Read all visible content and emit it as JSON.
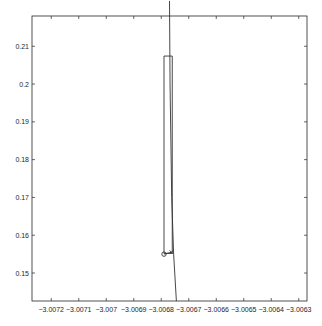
{
  "chart_data": {
    "type": "line",
    "title": "",
    "xlabel": "",
    "ylabel": "",
    "xlim": [
      -3.00727,
      -3.00627
    ],
    "ylim": [
      0.1426,
      0.218
    ],
    "grid": false,
    "legend": null,
    "x_ticks": [
      -3.0072,
      -3.0071,
      -3.007,
      -3.0069,
      -3.0068,
      -3.0067,
      -3.0066,
      -3.0065,
      -3.0064,
      -3.0063
    ],
    "x_tick_labels": [
      "-3.0072",
      "-3.0071",
      "-3.007",
      "-3.0069",
      "-3.0068",
      "-3.0067",
      "-3.0066",
      "-3.0065",
      "-3.0064",
      "-3.0063"
    ],
    "y_ticks": [
      0.15,
      0.16,
      0.17,
      0.18,
      0.19,
      0.2,
      0.21
    ],
    "y_tick_labels": [
      "0.15",
      "0.16",
      "0.17",
      "0.18",
      "0.19",
      "0.2",
      "0.21"
    ],
    "series": [
      {
        "name": "curve",
        "style": "line",
        "color": "#333333",
        "x": [
          -3.00677,
          -3.006768,
          -3.006762,
          -3.006755,
          -3.006745
        ],
        "y": [
          0.222,
          0.2,
          0.17,
          0.155,
          0.1426
        ]
      },
      {
        "name": "bounding-box",
        "style": "line",
        "color": "#333333",
        "x": [
          -3.00679,
          -3.00676,
          -3.00676,
          -3.00679,
          -3.00679
        ],
        "y": [
          0.2074,
          0.2074,
          0.1552,
          0.1552,
          0.2074
        ]
      },
      {
        "name": "start-point",
        "style": "marker-o",
        "color": "#333333",
        "x": [
          -3.00679
        ],
        "y": [
          0.155
        ]
      },
      {
        "name": "end-point",
        "style": "marker-x",
        "color": "#333333",
        "x": [
          -3.006763
        ],
        "y": [
          0.1555
        ]
      },
      {
        "name": "connector",
        "style": "line",
        "color": "#333333",
        "x": [
          -3.00679,
          -3.006763
        ],
        "y": [
          0.155,
          0.1555
        ]
      }
    ]
  },
  "plot_area": {
    "left": 32,
    "top": 16,
    "right": 307,
    "bottom": 301
  }
}
